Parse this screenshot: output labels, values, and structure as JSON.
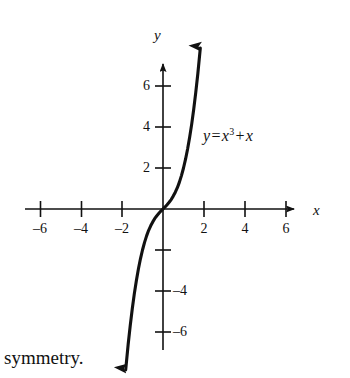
{
  "figure": {
    "background_color": "#ffffff",
    "ink_color": "#111111",
    "axis_letters": {
      "y": "y",
      "x": "x"
    },
    "equation": {
      "lhs": "y",
      "equals": "=",
      "base": "x",
      "exponent": "3",
      "plus": "+",
      "term": "x",
      "full_text": "y = x3 + x"
    },
    "caption": "symmetry."
  },
  "chart_data": {
    "type": "line",
    "title": "",
    "subtitle": "",
    "xlabel": "x",
    "ylabel": "y",
    "annotations": [
      {
        "text": "y = x3 + x",
        "x": 2.0,
        "y": 3.5
      }
    ],
    "legend": [],
    "legend_position": "none",
    "grid": false,
    "xlim": [
      -7,
      7
    ],
    "ylim": [
      -7,
      7
    ],
    "x_major_ticks": [
      -6,
      -4,
      -2,
      2,
      4,
      6
    ],
    "x_minor_ticks": [
      -7,
      -5,
      -3,
      -1,
      1,
      3,
      5,
      7
    ],
    "y_major_ticks": [
      6,
      4,
      2,
      -4,
      -6
    ],
    "y_unlabeled_ticks": [
      -2
    ],
    "x_tick_labels": [
      "–6",
      "–4",
      "–2",
      "2",
      "4",
      "6"
    ],
    "y_tick_labels_left": [
      "6",
      "4",
      "2"
    ],
    "y_tick_labels_right": [
      "–4",
      "–6"
    ],
    "axis_arrows": {
      "x_positive": true,
      "y_positive": true
    },
    "series": [
      {
        "name": "y = x3 + x",
        "equation": "y = x^3 + x",
        "arrow_start": true,
        "arrow_end": true,
        "x": [
          -1.82,
          -1.7,
          -1.6,
          -1.5,
          -1.4,
          -1.3,
          -1.2,
          -1.1,
          -1.0,
          -0.9,
          -0.8,
          -0.7,
          -0.6,
          -0.5,
          -0.4,
          -0.3,
          -0.2,
          -0.1,
          0.0,
          0.1,
          0.2,
          0.3,
          0.4,
          0.5,
          0.6,
          0.7,
          0.8,
          0.9,
          1.0,
          1.1,
          1.2,
          1.3,
          1.4,
          1.5,
          1.6,
          1.7,
          1.82
        ],
        "y": [
          -7.85,
          -6.61,
          -5.7,
          -4.88,
          -4.14,
          -3.5,
          -2.93,
          -2.43,
          -2.0,
          -1.63,
          -1.31,
          -1.04,
          -0.82,
          -0.63,
          -0.46,
          -0.33,
          -0.21,
          -0.1,
          0.0,
          0.1,
          0.21,
          0.33,
          0.46,
          0.63,
          0.82,
          1.04,
          1.31,
          1.63,
          2.0,
          2.43,
          2.93,
          3.5,
          4.14,
          4.88,
          5.7,
          6.61,
          7.85
        ]
      }
    ]
  }
}
